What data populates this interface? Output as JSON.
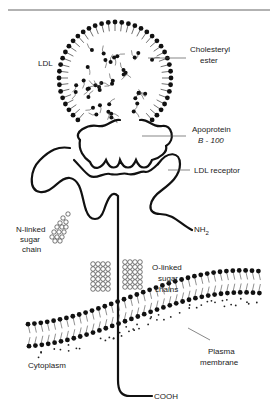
{
  "diagram": {
    "labels": {
      "ldl": "LDL",
      "cholesteryl_ester_1": "Cholesteryl",
      "cholesteryl_ester_2": "ester",
      "apoprotein_1": "Apoprotein",
      "apoprotein_2": "B - 100",
      "ldl_receptor": "LDL receptor",
      "nh2": "NH",
      "nh2_sub": "2",
      "n_linked_1": "N-linked",
      "n_linked_2": "sugar",
      "n_linked_3": "chain",
      "o_linked_1": "O-linked",
      "o_linked_2": "sugar",
      "o_linked_3": "chains",
      "plasma_1": "Plasma",
      "plasma_2": "membrane",
      "cytoplasm": "Cytoplasm",
      "cooh": "COOH"
    },
    "colors": {
      "ink": "#111111",
      "rule": "#888888"
    }
  }
}
